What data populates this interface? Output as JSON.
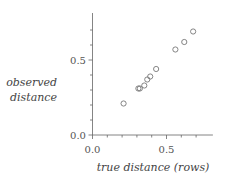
{
  "chart_data": {
    "type": "scatter",
    "title": "",
    "xlabel": "true distance (rows)",
    "ylabel": [
      "observed",
      "distance"
    ],
    "xlim": [
      0.0,
      0.8
    ],
    "ylim": [
      0.0,
      0.8
    ],
    "x_ticks": [
      0.0,
      0.5
    ],
    "y_ticks": [
      0.0,
      0.5
    ],
    "x_tick_labels": [
      "0.0",
      "0.5"
    ],
    "y_tick_labels": [
      "0.0",
      "0.5"
    ],
    "minor_tick_step": 0.1,
    "grid": false,
    "legend": null,
    "marker": "open-circle",
    "series": [
      {
        "name": "observations",
        "x": [
          0.21,
          0.31,
          0.32,
          0.35,
          0.37,
          0.39,
          0.43,
          0.56,
          0.62,
          0.68
        ],
        "y": [
          0.21,
          0.31,
          0.31,
          0.33,
          0.37,
          0.39,
          0.44,
          0.57,
          0.62,
          0.69
        ]
      }
    ]
  },
  "labels": {
    "x_axis": "true distance (rows)",
    "y_axis_line1": "observed",
    "y_axis_line2": "distance",
    "x_tick_0": "0.0",
    "x_tick_1": "0.5",
    "y_tick_0": "0.0",
    "y_tick_1": "0.5"
  }
}
